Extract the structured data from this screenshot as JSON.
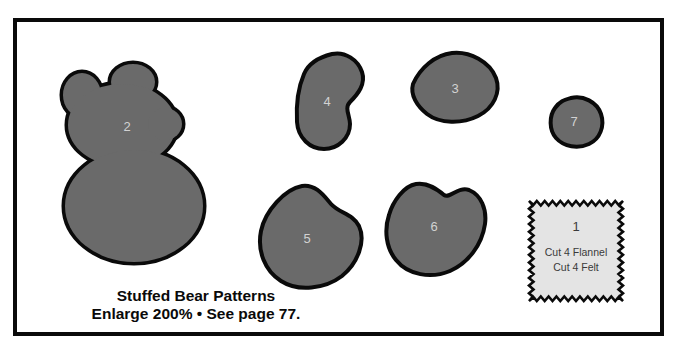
{
  "diagram": {
    "caption": {
      "title": "Stuffed Bear Patterns",
      "instructions": "Enlarge 200% • See page 77."
    },
    "pieces": {
      "p2": {
        "label": "2"
      },
      "p3": {
        "label": "3"
      },
      "p4": {
        "label": "4"
      },
      "p5": {
        "label": "5"
      },
      "p6": {
        "label": "6"
      },
      "p7": {
        "label": "7"
      }
    },
    "swatch": {
      "label": "1",
      "cut_lines": [
        "Cut 4 Flannel",
        "Cut 4 Felt"
      ]
    },
    "colors": {
      "piece_fill": "#6a6a6a",
      "outline": "#0a0a0a",
      "label_text": "#d2d2d2",
      "swatch_fill": "#e4e4e4",
      "swatch_text": "#3a3a3a"
    }
  }
}
